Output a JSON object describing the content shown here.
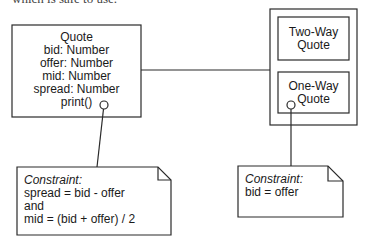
{
  "caption_clipped": "which is safe to use.",
  "quote_class": {
    "name": "Quote",
    "attributes": [
      "bid: Number",
      "offer: Number",
      "mid: Number",
      "spread: Number"
    ],
    "operations": [
      "print()"
    ]
  },
  "container": {
    "two_way": {
      "line1": "Two-Way",
      "line2": "Quote"
    },
    "one_way": {
      "line1": "One-Way",
      "line2": "Quote"
    }
  },
  "notes": {
    "left": {
      "title": "Constraint:",
      "lines": [
        "spread = bid - offer",
        "and",
        "mid = (bid + offer) / 2"
      ]
    },
    "right": {
      "title": "Constraint:",
      "lines": [
        "bid = offer"
      ]
    }
  },
  "colors": {
    "stroke": "#2a2a2a",
    "background": "#ffffff",
    "text": "#1a1a1a"
  }
}
